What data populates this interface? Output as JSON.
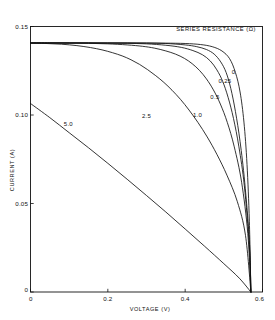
{
  "chart_data": {
    "type": "line",
    "title": "SERIES RESISTANCE (Ω)",
    "xlabel": "VOLTAGE (V)",
    "ylabel": "CURRENT (A)",
    "xlim": [
      0,
      0.6
    ],
    "ylim": [
      0,
      0.15
    ],
    "xticks": [
      0,
      0.2,
      0.4,
      0.6
    ],
    "xtick_labels": [
      "0",
      "0.2",
      "0.4",
      "0.6"
    ],
    "yticks": [
      0,
      0.05,
      0.1,
      0.15
    ],
    "ytick_labels": [
      "0",
      "0.05",
      "0.10",
      "0.15"
    ],
    "grid": false,
    "legend_position": "top-right-inline-labels",
    "short_circuit_current": 0.1407,
    "open_circuit_voltage": 0.57,
    "series": [
      {
        "name": "0",
        "label": "0",
        "series_resistance_ohm": 0,
        "label_position": {
          "x": 0.525,
          "y": 0.1233
        },
        "x": [
          0,
          0.05,
          0.1,
          0.15,
          0.2,
          0.25,
          0.3,
          0.35,
          0.4,
          0.44,
          0.47,
          0.495,
          0.515,
          0.53,
          0.542,
          0.552,
          0.56,
          0.566,
          0.57
        ],
        "y": [
          0.1407,
          0.1407,
          0.1407,
          0.1407,
          0.1407,
          0.1407,
          0.1407,
          0.1406,
          0.1404,
          0.1398,
          0.1386,
          0.1362,
          0.1318,
          0.124,
          0.113,
          0.096,
          0.072,
          0.04,
          0.0
        ]
      },
      {
        "name": "0.25",
        "label": "0.25",
        "series_resistance_ohm": 0.25,
        "label_position": {
          "x": 0.503,
          "y": 0.1182
        },
        "x": [
          0,
          0.05,
          0.1,
          0.15,
          0.2,
          0.25,
          0.3,
          0.35,
          0.4,
          0.43,
          0.455,
          0.475,
          0.492,
          0.506,
          0.518,
          0.53,
          0.542,
          0.554,
          0.566,
          0.57
        ],
        "y": [
          0.1407,
          0.1407,
          0.1407,
          0.1407,
          0.1407,
          0.1407,
          0.1406,
          0.1404,
          0.1396,
          0.1386,
          0.137,
          0.1344,
          0.13,
          0.124,
          0.115,
          0.102,
          0.085,
          0.062,
          0.029,
          0.0
        ]
      },
      {
        "name": "0.5",
        "label": "0.5",
        "series_resistance_ohm": 0.5,
        "label_position": {
          "x": 0.477,
          "y": 0.1093
        },
        "x": [
          0,
          0.05,
          0.1,
          0.15,
          0.2,
          0.25,
          0.3,
          0.35,
          0.39,
          0.42,
          0.445,
          0.465,
          0.482,
          0.497,
          0.511,
          0.525,
          0.539,
          0.553,
          0.566,
          0.57
        ],
        "y": [
          0.1407,
          0.1407,
          0.1407,
          0.1407,
          0.1406,
          0.1405,
          0.1402,
          0.1394,
          0.1382,
          0.1364,
          0.134,
          0.1305,
          0.1255,
          0.119,
          0.11,
          0.098,
          0.082,
          0.06,
          0.026,
          0.0
        ]
      },
      {
        "name": "1.0",
        "label": "1.0",
        "series_resistance_ohm": 1.0,
        "label_position": {
          "x": 0.432,
          "y": 0.099
        },
        "x": [
          0,
          0.05,
          0.1,
          0.15,
          0.2,
          0.25,
          0.29,
          0.32,
          0.35,
          0.375,
          0.398,
          0.418,
          0.437,
          0.455,
          0.473,
          0.491,
          0.509,
          0.527,
          0.546,
          0.562,
          0.57
        ],
        "y": [
          0.1407,
          0.1407,
          0.1406,
          0.1405,
          0.1402,
          0.1396,
          0.1388,
          0.1378,
          0.1362,
          0.1344,
          0.132,
          0.129,
          0.1252,
          0.1204,
          0.1142,
          0.1062,
          0.0958,
          0.082,
          0.062,
          0.033,
          0.0
        ]
      },
      {
        "name": "2.5",
        "label": "2.5",
        "series_resistance_ohm": 2.5,
        "label_position": {
          "x": 0.3,
          "y": 0.0985
        },
        "x": [
          0,
          0.04,
          0.08,
          0.12,
          0.155,
          0.185,
          0.212,
          0.237,
          0.26,
          0.282,
          0.303,
          0.324,
          0.345,
          0.366,
          0.388,
          0.41,
          0.433,
          0.457,
          0.482,
          0.508,
          0.535,
          0.556,
          0.57
        ],
        "y": [
          0.1406,
          0.1404,
          0.14,
          0.1392,
          0.1381,
          0.1368,
          0.1352,
          0.1334,
          0.1312,
          0.1286,
          0.1256,
          0.1222,
          0.1184,
          0.114,
          0.1088,
          0.1028,
          0.0958,
          0.0876,
          0.0778,
          0.066,
          0.051,
          0.032,
          0.0
        ]
      },
      {
        "name": "5.0",
        "label": "5.0",
        "series_resistance_ohm": 5.0,
        "label_position": {
          "x": 0.098,
          "y": 0.094
        },
        "x": [
          0,
          0.05,
          0.1,
          0.15,
          0.2,
          0.25,
          0.3,
          0.35,
          0.4,
          0.45,
          0.5,
          0.54,
          0.57
        ],
        "y": [
          0.1065,
          0.0985,
          0.09,
          0.0815,
          0.0727,
          0.0637,
          0.0545,
          0.0452,
          0.0356,
          0.0259,
          0.016,
          0.0078,
          0.0
        ]
      }
    ]
  },
  "colors": {
    "axis": "#111111",
    "curve": "#111111",
    "background": "#ffffff"
  }
}
